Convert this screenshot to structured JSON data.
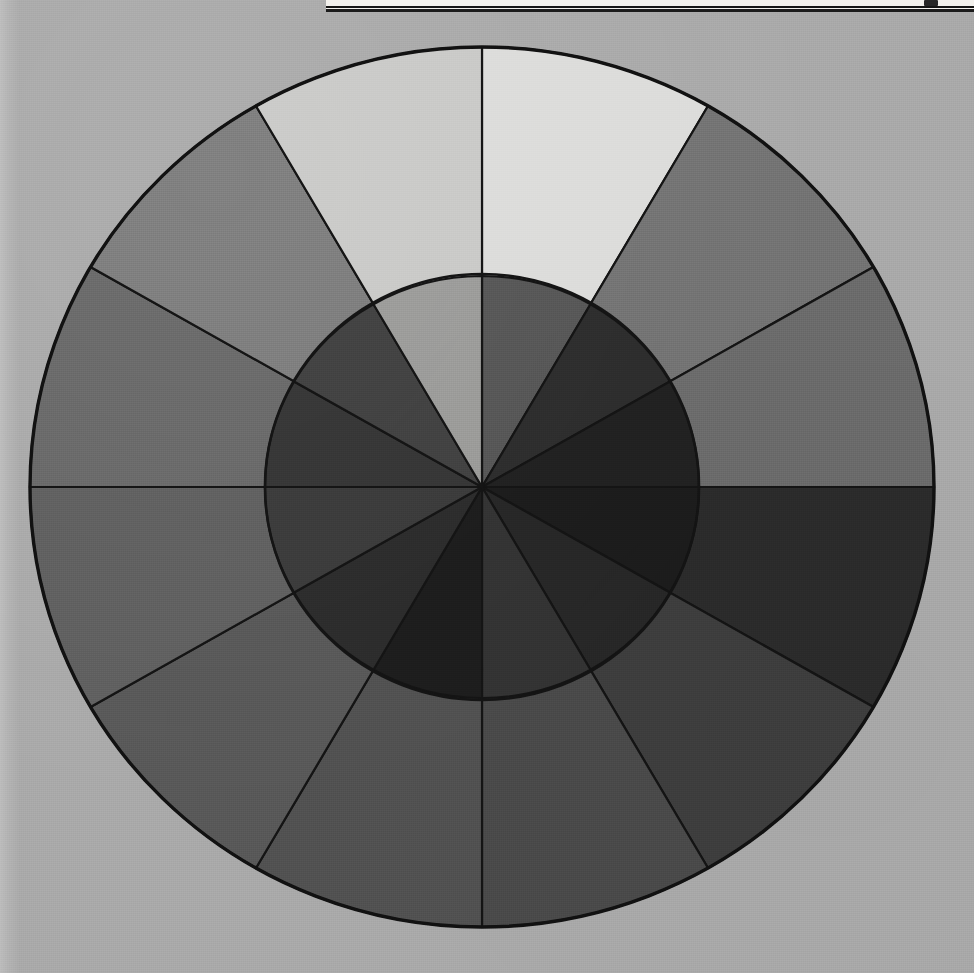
{
  "figure": {
    "kind": "value-scale-colour-wheel",
    "caption_sliver_visible": true,
    "background_color": "#a9a9a9",
    "stroke_color": "#141414"
  },
  "chart_data": {
    "type": "pie",
    "title": "",
    "subtitle": "",
    "xlabel": "",
    "ylabel": "",
    "legend_position": "none",
    "grid": false,
    "center": {
      "x": 482,
      "y": 487
    },
    "radii": {
      "inner_disk": 217,
      "outer_ring": 452,
      "outer_ring_y": 440
    },
    "sector_count": 12,
    "sector_angle_deg": 30,
    "start_angle_deg": -90,
    "categories": [
      "0 (12 o'clock)",
      "1",
      "2",
      "3 (3 o'clock)",
      "4",
      "5",
      "6 (6 o'clock)",
      "7",
      "8",
      "9 (9 o'clock)",
      "10",
      "11"
    ],
    "series": [
      {
        "name": "Outer ring value",
        "values": [
          92,
          52,
          46,
          22,
          30,
          36,
          40,
          44,
          50,
          56,
          62,
          85
        ],
        "colors": [
          "#dcdcda",
          "#737373",
          "#6b6b6b",
          "#2b2b2b",
          "#3e3e3e",
          "#4a4a4a",
          "#515151",
          "#585858",
          "#5f5f5f",
          "#686868",
          "#7b7b7b",
          "#c9c9c7"
        ]
      },
      {
        "name": "Inner disk value",
        "values": [
          44,
          26,
          20,
          16,
          22,
          28,
          17,
          26,
          33,
          30,
          36,
          74
        ],
        "colors": [
          "#565656",
          "#2d2d2d",
          "#212121",
          "#1c1c1c",
          "#272727",
          "#333333",
          "#1d1d1d",
          "#2c2c2c",
          "#3b3b3b",
          "#363636",
          "#414141",
          "#9a9a98"
        ]
      }
    ],
    "axis_ranges": {
      "value_min": 0,
      "value_max": 100
    }
  },
  "outer_sectors": [
    {
      "index": 0,
      "label": "outer-sector-0",
      "start_deg": -90,
      "end_deg": -60,
      "fill": "#dcdcda",
      "value": 92
    },
    {
      "index": 1,
      "label": "outer-sector-1",
      "start_deg": -60,
      "end_deg": -30,
      "fill": "#737373",
      "value": 52
    },
    {
      "index": 2,
      "label": "outer-sector-2",
      "start_deg": -30,
      "end_deg": 0,
      "fill": "#6b6b6b",
      "value": 46
    },
    {
      "index": 3,
      "label": "outer-sector-3",
      "start_deg": 0,
      "end_deg": 30,
      "fill": "#2b2b2b",
      "value": 22
    },
    {
      "index": 4,
      "label": "outer-sector-4",
      "start_deg": 30,
      "end_deg": 60,
      "fill": "#3e3e3e",
      "value": 30
    },
    {
      "index": 5,
      "label": "outer-sector-5",
      "start_deg": 60,
      "end_deg": 90,
      "fill": "#4a4a4a",
      "value": 36
    },
    {
      "index": 6,
      "label": "outer-sector-6",
      "start_deg": 90,
      "end_deg": 120,
      "fill": "#515151",
      "value": 40
    },
    {
      "index": 7,
      "label": "outer-sector-7",
      "start_deg": 120,
      "end_deg": 150,
      "fill": "#585858",
      "value": 44
    },
    {
      "index": 8,
      "label": "outer-sector-8",
      "start_deg": 150,
      "end_deg": 180,
      "fill": "#5f5f5f",
      "value": 50
    },
    {
      "index": 9,
      "label": "outer-sector-9",
      "start_deg": 180,
      "end_deg": 210,
      "fill": "#686868",
      "value": 56
    },
    {
      "index": 10,
      "label": "outer-sector-10",
      "start_deg": 210,
      "end_deg": 240,
      "fill": "#7b7b7b",
      "value": 62
    },
    {
      "index": 11,
      "label": "outer-sector-11",
      "start_deg": 240,
      "end_deg": 270,
      "fill": "#c9c9c7",
      "value": 85
    }
  ],
  "inner_sectors": [
    {
      "index": 0,
      "label": "inner-sector-0",
      "start_deg": -90,
      "end_deg": -60,
      "fill": "#565656",
      "value": 44
    },
    {
      "index": 1,
      "label": "inner-sector-1",
      "start_deg": -60,
      "end_deg": -30,
      "fill": "#2d2d2d",
      "value": 26
    },
    {
      "index": 2,
      "label": "inner-sector-2",
      "start_deg": -30,
      "end_deg": 0,
      "fill": "#212121",
      "value": 20
    },
    {
      "index": 3,
      "label": "inner-sector-3",
      "start_deg": 0,
      "end_deg": 30,
      "fill": "#1c1c1c",
      "value": 16
    },
    {
      "index": 4,
      "label": "inner-sector-4",
      "start_deg": 30,
      "end_deg": 60,
      "fill": "#272727",
      "value": 22
    },
    {
      "index": 5,
      "label": "inner-sector-5",
      "start_deg": 60,
      "end_deg": 90,
      "fill": "#333333",
      "value": 28
    },
    {
      "index": 6,
      "label": "inner-sector-6",
      "start_deg": 90,
      "end_deg": 120,
      "fill": "#1d1d1d",
      "value": 17
    },
    {
      "index": 7,
      "label": "inner-sector-7",
      "start_deg": 120,
      "end_deg": 150,
      "fill": "#2c2c2c",
      "value": 26
    },
    {
      "index": 8,
      "label": "inner-sector-8",
      "start_deg": 150,
      "end_deg": 180,
      "fill": "#3b3b3b",
      "value": 33
    },
    {
      "index": 9,
      "label": "inner-sector-9",
      "start_deg": 180,
      "end_deg": 210,
      "fill": "#363636",
      "value": 30
    },
    {
      "index": 10,
      "label": "inner-sector-10",
      "start_deg": 210,
      "end_deg": 240,
      "fill": "#414141",
      "value": 36
    },
    {
      "index": 11,
      "label": "inner-sector-11",
      "start_deg": 240,
      "end_deg": 270,
      "fill": "#9a9a98",
      "value": 74
    }
  ]
}
